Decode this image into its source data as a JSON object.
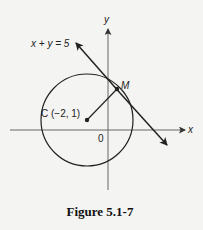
{
  "figure": {
    "caption": "Figure 5.1-7",
    "axes": {
      "x_label": "x",
      "y_label": "y",
      "origin_label": "0"
    },
    "line": {
      "equation": "x + y = 5"
    },
    "circle": {
      "center_label": "C (−2, 1)",
      "center": [
        -2,
        1
      ]
    },
    "point": {
      "label": "M"
    }
  }
}
